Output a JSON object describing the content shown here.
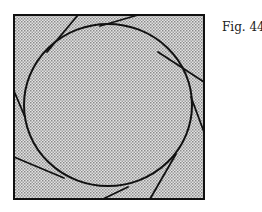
{
  "figure": {
    "caption": "Fig. 44",
    "square": {
      "x": 14,
      "y": 15,
      "width": 190,
      "height": 184
    },
    "circle": {
      "cx": 108,
      "cy": 105,
      "rx": 84,
      "ry": 81
    },
    "tangent_lines": [
      {
        "x1": 78,
        "y1": 15,
        "x2": 47,
        "y2": 52
      },
      {
        "x1": 138,
        "y1": 15,
        "x2": 100,
        "y2": 26
      },
      {
        "x1": 204,
        "y1": 82,
        "x2": 158,
        "y2": 52
      },
      {
        "x1": 204,
        "y1": 132,
        "x2": 191,
        "y2": 97
      },
      {
        "x1": 150,
        "y1": 199,
        "x2": 176,
        "y2": 154
      },
      {
        "x1": 103,
        "y1": 199,
        "x2": 128,
        "y2": 187
      },
      {
        "x1": 14,
        "y1": 157,
        "x2": 64,
        "y2": 178
      },
      {
        "x1": 14,
        "y1": 91,
        "x2": 25,
        "y2": 117
      }
    ],
    "colors": {
      "fill": "#c9c9c9",
      "stroke": "#111111"
    }
  }
}
